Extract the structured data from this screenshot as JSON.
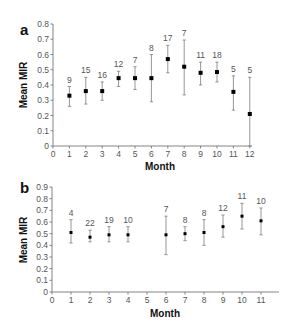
{
  "chart_data": [
    {
      "type": "scatter",
      "panel": "a",
      "title": "",
      "xlabel": "Month",
      "ylabel": "Mean MIR",
      "xlim": [
        0,
        12
      ],
      "ylim": [
        0,
        0.8
      ],
      "x_ticks": [
        0,
        1,
        2,
        3,
        4,
        5,
        6,
        7,
        8,
        9,
        10,
        11,
        12
      ],
      "y_ticks": [
        0,
        0.1,
        0.2,
        0.3,
        0.4,
        0.5,
        0.6,
        0.7,
        0.8
      ],
      "grid": false,
      "legend": null,
      "x": [
        1,
        2,
        3,
        4,
        5,
        6,
        7,
        8,
        9,
        10,
        11,
        12
      ],
      "values": [
        0.33,
        0.36,
        0.36,
        0.445,
        0.445,
        0.445,
        0.57,
        0.52,
        0.48,
        0.485,
        0.355,
        0.21
      ],
      "error_upper": [
        0.39,
        0.45,
        0.42,
        0.49,
        0.52,
        0.6,
        0.66,
        0.695,
        0.55,
        0.55,
        0.46,
        0.45
      ],
      "error_lower": [
        0.26,
        0.275,
        0.3,
        0.39,
        0.37,
        0.29,
        0.48,
        0.335,
        0.4,
        0.42,
        0.235,
        0.0
      ],
      "n_labels": [
        "9",
        "15",
        "16",
        "12",
        "7",
        "8",
        "17",
        "7",
        "11",
        "18",
        "5",
        "5"
      ]
    },
    {
      "type": "scatter",
      "panel": "b",
      "title": "",
      "xlabel": "Month",
      "ylabel": "Mean MIR",
      "xlim": [
        0,
        12
      ],
      "ylim": [
        0,
        0.9
      ],
      "x_ticks": [
        0,
        1,
        2,
        3,
        4,
        5,
        6,
        7,
        8,
        9,
        10,
        11
      ],
      "y_ticks": [
        0,
        0.1,
        0.2,
        0.3,
        0.4,
        0.5,
        0.6,
        0.7,
        0.8,
        0.9
      ],
      "grid": false,
      "legend": null,
      "x": [
        1,
        2,
        3,
        4,
        6,
        7,
        8,
        9,
        10,
        11
      ],
      "values": [
        0.51,
        0.47,
        0.49,
        0.49,
        0.49,
        0.5,
        0.51,
        0.56,
        0.65,
        0.61
      ],
      "error_upper": [
        0.62,
        0.53,
        0.56,
        0.56,
        0.65,
        0.56,
        0.62,
        0.66,
        0.76,
        0.72
      ],
      "error_lower": [
        0.42,
        0.43,
        0.43,
        0.43,
        0.32,
        0.44,
        0.4,
        0.47,
        0.54,
        0.49
      ],
      "n_labels": [
        "4",
        "22",
        "19",
        "10",
        "7",
        "8",
        "8",
        "12",
        "11",
        "10"
      ]
    }
  ],
  "layout": [
    {
      "x0": 53,
      "xUnit": 16.4,
      "xEnd": 252,
      "y0": 146,
      "yTop": 24,
      "labelX": 20,
      "labelY": 35,
      "titleX": 160,
      "titleY": 170,
      "ylabelX": 27,
      "ylabelY": 85
    },
    {
      "x0": 52,
      "xUnit": 19.0,
      "xEnd": 279,
      "y0": 292,
      "yTop": 187,
      "labelX": 20,
      "labelY": 193,
      "titleX": 165,
      "titleY": 317,
      "ylabelX": 27,
      "ylabelY": 240
    }
  ],
  "colors": {
    "marker": "#000000",
    "errorbar": "#8a8a8a",
    "axis": "#777777",
    "text": "#555555"
  }
}
